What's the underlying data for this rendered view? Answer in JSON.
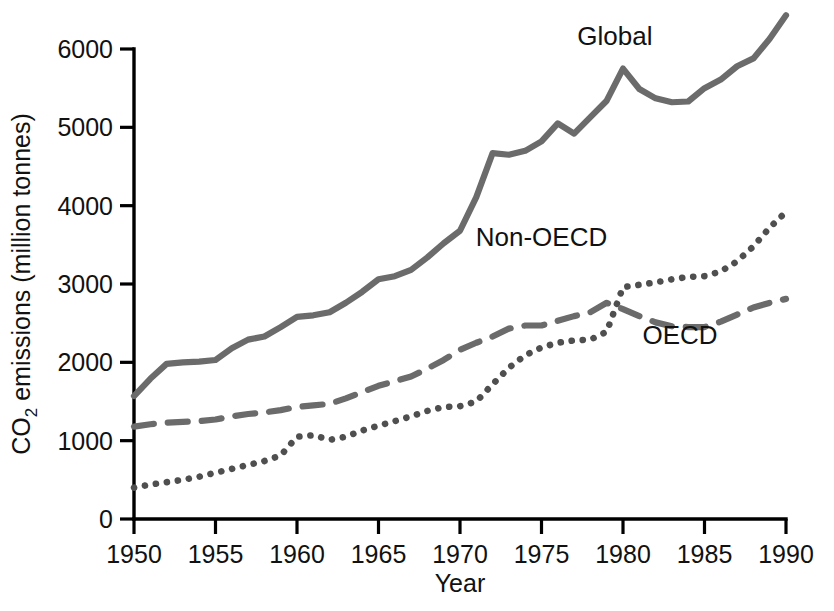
{
  "chart_data": {
    "type": "line",
    "title": "",
    "xlabel": "Year",
    "ylabel": "CO2 emissions (million tonnes)",
    "ylabel_main": "CO",
    "ylabel_sub": "2",
    "ylabel_rest": " emissions (million tonnes)",
    "xlim": [
      1950,
      1990
    ],
    "ylim": [
      0,
      6000
    ],
    "grid": false,
    "legend_position": "inline-annotations",
    "xticks": [
      1950,
      1955,
      1960,
      1965,
      1970,
      1975,
      1980,
      1985,
      1990
    ],
    "xtick_labels": [
      "1950",
      "1955",
      "1960",
      "1965",
      "1970",
      "1975",
      "1980",
      "1985",
      "1990"
    ],
    "yticks": [
      0,
      1000,
      2000,
      3000,
      4000,
      5000,
      6000
    ],
    "ytick_labels": [
      "0",
      "1000",
      "2000",
      "3000",
      "4000",
      "5000",
      "6000"
    ],
    "x": [
      1950,
      1951,
      1952,
      1953,
      1954,
      1955,
      1956,
      1957,
      1958,
      1959,
      1960,
      1961,
      1962,
      1963,
      1964,
      1965,
      1966,
      1967,
      1968,
      1969,
      1970,
      1971,
      1972,
      1973,
      1974,
      1975,
      1976,
      1977,
      1978,
      1979,
      1980,
      1981,
      1982,
      1983,
      1984,
      1985,
      1986,
      1987,
      1988,
      1989,
      1990
    ],
    "series": [
      {
        "name": "Global",
        "label": "Global",
        "style": "solid",
        "color": "#6b6b6b",
        "label_x": 1979.5,
        "label_y": 6050,
        "values": [
          1570,
          1790,
          1980,
          2000,
          2010,
          2030,
          2180,
          2290,
          2330,
          2450,
          2580,
          2600,
          2640,
          2760,
          2900,
          3060,
          3100,
          3180,
          3340,
          3520,
          3680,
          4110,
          4670,
          4650,
          4700,
          4820,
          5050,
          4920,
          5130,
          5340,
          5750,
          5490,
          5370,
          5320,
          5330,
          5500,
          5610,
          5780,
          5880,
          6130,
          6430
        ]
      },
      {
        "name": "Non-OECD",
        "label": "Non-OECD",
        "style": "dotted",
        "color": "#4f4f4f",
        "label_x": 1975.0,
        "label_y": 3490,
        "values": [
          400,
          440,
          470,
          500,
          540,
          590,
          640,
          690,
          740,
          810,
          1050,
          1070,
          1010,
          1050,
          1130,
          1190,
          1250,
          1310,
          1380,
          1430,
          1440,
          1500,
          1720,
          1930,
          2090,
          2190,
          2250,
          2280,
          2290,
          2390,
          2960,
          2990,
          3020,
          3060,
          3090,
          3100,
          3160,
          3290,
          3480,
          3720,
          3920
        ]
      },
      {
        "name": "OECD",
        "label": "OECD",
        "style": "dashed",
        "color": "#6b6b6b",
        "label_x": 1983.5,
        "label_y": 2240,
        "values": [
          1180,
          1210,
          1230,
          1240,
          1250,
          1270,
          1310,
          1340,
          1360,
          1390,
          1430,
          1450,
          1470,
          1540,
          1620,
          1700,
          1760,
          1820,
          1920,
          2030,
          2160,
          2250,
          2330,
          2430,
          2470,
          2470,
          2530,
          2590,
          2640,
          2760,
          2680,
          2590,
          2510,
          2460,
          2450,
          2450,
          2520,
          2610,
          2700,
          2760,
          2810
        ]
      }
    ]
  }
}
